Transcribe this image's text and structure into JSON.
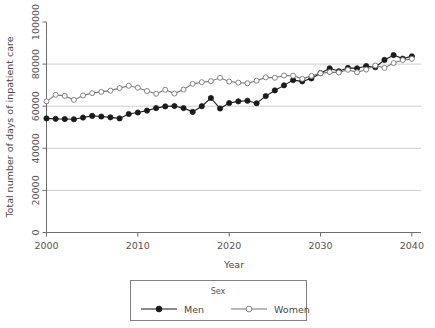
{
  "chart_data": {
    "type": "line",
    "title": "",
    "xlabel": "Year",
    "ylabel": "Total number of days of inpatient care",
    "xlim": [
      2000,
      2041
    ],
    "ylim": [
      0,
      100000
    ],
    "xticks": [
      "2000",
      "2010",
      "2020",
      "2030",
      "2040"
    ],
    "xtick_values": [
      2000,
      2010,
      2020,
      2030,
      2040
    ],
    "yticks": [
      "0",
      "20000",
      "40000",
      "60000",
      "80000",
      "100000"
    ],
    "ytick_values": [
      0,
      20000,
      40000,
      60000,
      80000,
      100000
    ],
    "grid": "horizontal",
    "gridline_values": [
      20000,
      40000,
      60000,
      80000
    ],
    "legend": {
      "title": "Sex",
      "position": "bottom-outside",
      "entries": [
        {
          "label": "Men",
          "marker": "filled-circle",
          "color": "#1a1a1a"
        },
        {
          "label": "Women",
          "marker": "open-circle",
          "color": "#777777"
        }
      ]
    },
    "x": [
      2000,
      2001,
      2002,
      2003,
      2004,
      2005,
      2006,
      2007,
      2008,
      2009,
      2010,
      2011,
      2012,
      2013,
      2014,
      2015,
      2016,
      2017,
      2018,
      2019,
      2020,
      2021,
      2022,
      2023,
      2024,
      2025,
      2026,
      2027,
      2028,
      2029,
      2030,
      2031,
      2032,
      2033,
      2034,
      2035,
      2036,
      2037,
      2038,
      2039,
      2040
    ],
    "series": [
      {
        "name": "Men",
        "marker": "filled-circle",
        "color": "#1a1a1a",
        "values": [
          54200,
          54000,
          53900,
          53800,
          54600,
          55400,
          55100,
          54700,
          54200,
          56300,
          57000,
          57900,
          59100,
          59900,
          60100,
          59100,
          57300,
          60000,
          63900,
          58900,
          61500,
          62300,
          62600,
          61400,
          64800,
          67500,
          69900,
          72400,
          71800,
          73200,
          75700,
          78000,
          76600,
          78200,
          78000,
          79100,
          78500,
          82000,
          84300,
          82600,
          83700
        ]
      },
      {
        "name": "Women",
        "marker": "open-circle",
        "color": "#777777",
        "values": [
          62300,
          65400,
          64900,
          63000,
          65100,
          66200,
          66800,
          67400,
          68600,
          69700,
          68800,
          67200,
          65900,
          67800,
          66000,
          67900,
          70600,
          71400,
          71900,
          73500,
          71700,
          71200,
          70900,
          72100,
          73700,
          73500,
          74600,
          74500,
          73000,
          74400,
          75600,
          76200,
          76000,
          77300,
          76100,
          77400,
          79300,
          78200,
          80500,
          81900,
          82500
        ]
      }
    ]
  }
}
